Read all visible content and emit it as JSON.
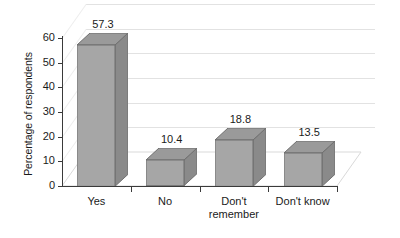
{
  "chart_data": {
    "type": "bar",
    "title": "",
    "subtitle": "",
    "xlabel": "",
    "ylabel": "Percentage of respondents",
    "categories": [
      "Yes",
      "No",
      "Don't\nremember",
      "Don't know"
    ],
    "values": [
      57.3,
      10.4,
      18.8,
      13.5
    ],
    "value_labels": [
      "57.3",
      "10.4",
      "18.8",
      "13.5"
    ],
    "ylim": [
      0,
      60
    ],
    "yticks": [
      0,
      10,
      20,
      30,
      40,
      50,
      60
    ],
    "ytick_labels": [
      "0",
      "10",
      "20",
      "30",
      "40",
      "50",
      "60"
    ],
    "grid": true,
    "legend": "none",
    "style": "3d-bar",
    "colors": {
      "bar_front": "#a6a6a6",
      "bar_side": "#8a8a8a",
      "bar_top": "#9a9a9a",
      "bar_edge": "#6f6f6f",
      "axis": "#3a3a3a",
      "gridline": "#e2e2e2",
      "background": "#ffffff",
      "text": "#1a1a1a"
    }
  }
}
